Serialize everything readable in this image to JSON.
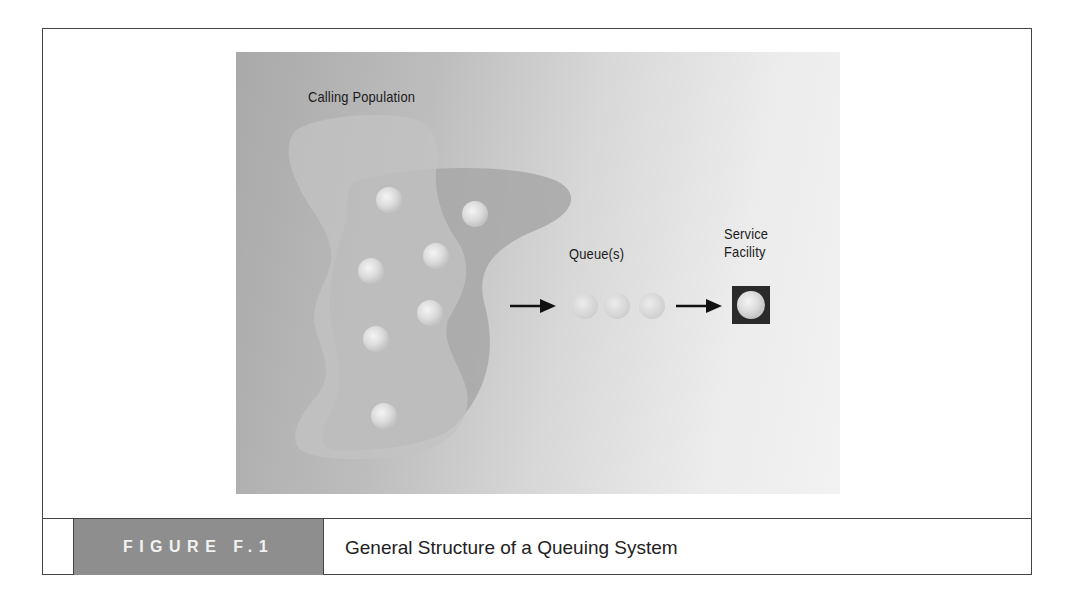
{
  "figure": {
    "number_label": "FIGURE F.1",
    "caption": "General Structure of a Queuing System"
  },
  "diagram": {
    "labels": {
      "calling_population": "Calling Population",
      "queue": "Queue(s)",
      "service_facility_line1": "Service",
      "service_facility_line2": "Facility"
    },
    "population_units": 7,
    "queue_units": 3,
    "server_units": 1,
    "colors": {
      "background_dark": "#a9a9a9",
      "background_light": "#f2f2f2",
      "caption_box": "#8e8e8e",
      "server_box": "#2a2a2a",
      "arrow": "#111111"
    }
  }
}
